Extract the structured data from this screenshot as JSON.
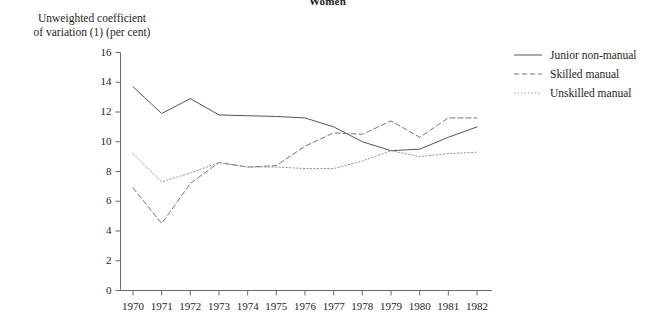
{
  "chart_data": {
    "type": "line",
    "title": "Women",
    "ylabel_line1": "Unweighted coefficient",
    "ylabel_line2": "of variation (1) (per cent)",
    "xlabel": "",
    "ylim": [
      0,
      16
    ],
    "yticks": [
      0,
      2,
      4,
      6,
      8,
      10,
      12,
      14,
      16
    ],
    "ytick_labels": [
      "0",
      "2",
      "4",
      "6",
      "8",
      "10",
      "12",
      "14",
      "16"
    ],
    "categories": [
      1970,
      1971,
      1972,
      1973,
      1974,
      1975,
      1976,
      1977,
      1978,
      1979,
      1980,
      1981,
      1982
    ],
    "xtick_labels": [
      "1970",
      "1971",
      "1972",
      "1973",
      "1974",
      "1975",
      "1976",
      "1977",
      "1978",
      "1979",
      "1980",
      "1981",
      "1982"
    ],
    "grid": false,
    "legend_position": "right",
    "series": [
      {
        "name": "Junior non-manual",
        "style": "solid",
        "color": "#555555",
        "values": [
          13.7,
          11.9,
          12.9,
          11.8,
          11.75,
          11.7,
          11.6,
          11.0,
          10.0,
          9.4,
          9.5,
          10.3,
          11.0
        ]
      },
      {
        "name": "Skilled manual",
        "style": "dashed",
        "color": "#777777",
        "values": [
          6.9,
          4.5,
          7.2,
          8.6,
          8.3,
          8.4,
          9.7,
          10.6,
          10.5,
          11.4,
          10.3,
          11.6,
          11.6
        ]
      },
      {
        "name": "Unskilled manual",
        "style": "dotted",
        "color": "#999999",
        "values": [
          9.2,
          7.3,
          7.9,
          8.6,
          8.3,
          8.3,
          8.2,
          8.2,
          8.7,
          9.4,
          9.0,
          9.2,
          9.3
        ]
      }
    ]
  },
  "legend": {
    "items": [
      {
        "label": "Junior non-manual"
      },
      {
        "label": "Skilled manual"
      },
      {
        "label": "Unskilled manual"
      }
    ]
  },
  "axis_colors": {
    "axis_line": "#6b6b6b",
    "text": "#231f20"
  }
}
